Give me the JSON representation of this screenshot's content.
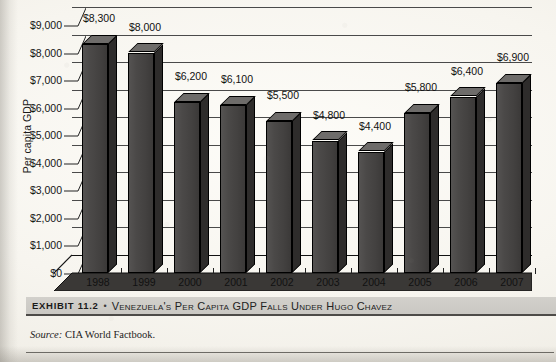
{
  "chart_data": {
    "type": "bar",
    "title": "Venezuela's Per Capita GDP Falls Under Hugo Chavez",
    "xlabel": "",
    "ylabel": "Per capita GDP",
    "categories": [
      "1998",
      "1999",
      "2000",
      "2001",
      "2002",
      "2003",
      "2004",
      "2005",
      "2006",
      "2007"
    ],
    "values": [
      8300,
      8000,
      6200,
      6100,
      5500,
      4800,
      4400,
      5800,
      6400,
      6900
    ],
    "value_labels": [
      "$8,300",
      "$8,000",
      "$6,200",
      "$6,100",
      "$5,500",
      "$4,800",
      "$4,400",
      "$5,800",
      "$6,400",
      "$6,900"
    ],
    "ylim": [
      0,
      9000
    ],
    "ytick_values": [
      0,
      1000,
      2000,
      3000,
      4000,
      5000,
      6000,
      7000,
      8000,
      9000
    ],
    "ytick_labels": [
      "$0",
      "$1,000",
      "$2,000",
      "$3,000",
      "$4,000",
      "$5,000",
      "$6,000",
      "$7,000",
      "$8,000",
      "$9,000"
    ],
    "grid": true,
    "legend": "none",
    "style_3d": true,
    "bar_color": "#4a4847",
    "bar_top_color": "#6e6c6a",
    "bar_side_color": "#2e2c2b"
  },
  "caption": {
    "exhibit_label": "EXHIBIT 11.2",
    "separator": "•",
    "title": "Venezuela's Per Capita GDP Falls Under Hugo Chavez"
  },
  "source": {
    "label": "Source:",
    "text": "CIA World Factbook."
  }
}
